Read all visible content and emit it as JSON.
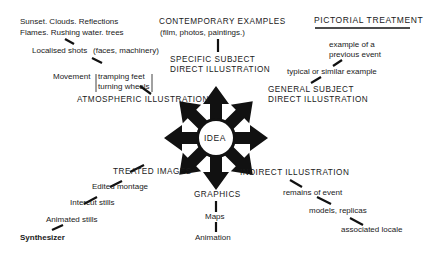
{
  "title": "PICTORIAL TREATMENT",
  "center": "IDEA",
  "branches": {
    "contemporary": {
      "heading": "CONTEMPORARY EXAMPLES",
      "sub": "(film, photos, paintings.)"
    },
    "specific": {
      "line1": "SPECIFIC SUBJECT",
      "line2": "DIRECT ILLUSTRATION"
    },
    "general": {
      "line1": "GENERAL SUBJECT",
      "line2": "DIRECT ILLUSTRATION",
      "items": [
        "typical or similar example",
        "example of a",
        "previous event"
      ]
    },
    "atmospheric": {
      "heading": "ATMOSPHERIC ILLUSTRATION",
      "movement": "Movement",
      "movement_items": [
        "tramping feet",
        "turning wheels"
      ],
      "localised": "Localised shots",
      "localised_note": "(faces, machinery)",
      "line_a": "Sunset. Clouds. Reflections",
      "line_b": "Flames. Rushing water. trees"
    },
    "treated": {
      "heading": "TREATED IMAGES",
      "items": [
        "Edited montage",
        "Intercut stills",
        "Animated stills",
        "Synthesizer"
      ]
    },
    "graphics": {
      "heading": "GRAPHICS",
      "items": [
        "Maps",
        "Animation"
      ]
    },
    "indirect": {
      "heading": "INDIRECT ILLUSTRATION",
      "items": [
        "remains of event",
        "models, replicas",
        "associated locale"
      ]
    }
  }
}
